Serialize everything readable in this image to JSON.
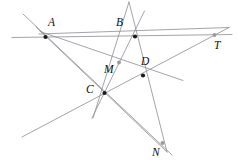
{
  "figure": {
    "width": 238,
    "height": 167,
    "background_color": "#ffffff",
    "line_color": "#8d8d93",
    "point_color": "#1a1a1a",
    "light_point_color": "#9a9aa0",
    "points": [
      {
        "id": "A",
        "label": "A",
        "x": 45.5,
        "y": 37.0,
        "style": "solid",
        "label_x": 48.0,
        "label_y": 16.5
      },
      {
        "id": "B",
        "label": "B",
        "x": 135.0,
        "y": 36.5,
        "style": "solid",
        "label_x": 116.0,
        "label_y": 16.5
      },
      {
        "id": "T",
        "label": "T",
        "x": 214.5,
        "y": 35.0,
        "style": "light",
        "label_x": 214.0,
        "label_y": 39.5
      },
      {
        "id": "M",
        "label": "M",
        "x": 119.0,
        "y": 62.5,
        "style": "light",
        "label_x": 104.0,
        "label_y": 64.0
      },
      {
        "id": "D",
        "label": "D",
        "x": 143.0,
        "y": 75.5,
        "style": "solid",
        "label_x": 141.0,
        "label_y": 55.5
      },
      {
        "id": "C",
        "label": "C",
        "x": 104.5,
        "y": 93.0,
        "style": "solid",
        "label_x": 86.0,
        "label_y": 84.0
      },
      {
        "id": "N",
        "label": "N",
        "x": 162.5,
        "y": 143.0,
        "style": "light",
        "label_x": 152.0,
        "label_y": 146.5
      }
    ],
    "lines": [
      {
        "id": "line-ABT",
        "name": "horizontal-line-A-B-T",
        "x1": 12.0,
        "y1": 37.5,
        "x2": 232.0,
        "y2": 34.5,
        "weight": "normal"
      },
      {
        "id": "line-AD-T",
        "name": "line-A-D-T",
        "x1": 39.0,
        "y1": 34.0,
        "x2": 229.0,
        "y2": 27.5,
        "weight": "normal"
      },
      {
        "id": "line-A-N",
        "name": "line-A-through-D-to-N",
        "x1": 23.0,
        "y1": 14.0,
        "x2": 172.0,
        "y2": 155.0,
        "weight": "normal"
      },
      {
        "id": "line-A-Mright",
        "name": "line-A-through-M-to-right",
        "x1": 40.0,
        "y1": 31.5,
        "x2": 183.0,
        "y2": 80.5,
        "weight": "normal"
      },
      {
        "id": "line-A-C-N",
        "name": "line-A-through-C-down",
        "x1": 36.0,
        "y1": 27.0,
        "x2": 167.0,
        "y2": 152.0,
        "weight": "normal"
      },
      {
        "id": "line-B-C",
        "name": "line-B-through-C-lower-left",
        "x1": 144.5,
        "y1": 11.0,
        "x2": 92.0,
        "y2": 118.0,
        "weight": "normal"
      },
      {
        "id": "line-B-N",
        "name": "line-B-through-D-to-N",
        "x1": 129.0,
        "y1": 2.0,
        "x2": 167.0,
        "y2": 152.0,
        "weight": "normal"
      },
      {
        "id": "line-C-T",
        "name": "line-lower-left-through-C-D-to-T",
        "x1": 22.0,
        "y1": 137.0,
        "x2": 229.0,
        "y2": 27.5,
        "weight": "normal"
      },
      {
        "id": "line-M-C-down",
        "name": "line-M-through-C-downward",
        "x1": 129.0,
        "y1": 2.0,
        "x2": 93.0,
        "y2": 118.0,
        "weight": "normal"
      }
    ]
  }
}
